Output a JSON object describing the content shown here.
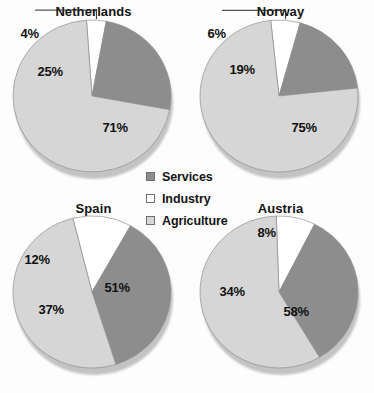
{
  "chart_data": [
    {
      "type": "pie",
      "title": "Netherlands",
      "categories": [
        "Industry",
        "Services",
        "Agriculture"
      ],
      "values": [
        4,
        25,
        71
      ],
      "labels": [
        "4%",
        "25%",
        "71%"
      ],
      "colors": [
        "#ffffff",
        "#8d8d8d",
        "#d6d6d6"
      ],
      "legend_position": "center",
      "has_leader_line": true
    },
    {
      "type": "pie",
      "title": "Norway",
      "categories": [
        "Industry",
        "Services",
        "Agriculture"
      ],
      "values": [
        6,
        19,
        75
      ],
      "labels": [
        "6%",
        "19%",
        "75%"
      ],
      "colors": [
        "#ffffff",
        "#8d8d8d",
        "#d6d6d6"
      ],
      "legend_position": "center",
      "has_leader_line": true
    },
    {
      "type": "pie",
      "title": "Spain",
      "categories": [
        "Industry",
        "Services",
        "Agriculture"
      ],
      "values": [
        12,
        37,
        51
      ],
      "labels": [
        "12%",
        "37%",
        "51%"
      ],
      "colors": [
        "#ffffff",
        "#8d8d8d",
        "#d6d6d6"
      ],
      "legend_position": "center",
      "has_leader_line": false
    },
    {
      "type": "pie",
      "title": "Austria",
      "categories": [
        "Industry",
        "Services",
        "Agriculture"
      ],
      "values": [
        8,
        34,
        58
      ],
      "labels": [
        "8%",
        "34%",
        "58%"
      ],
      "colors": [
        "#ffffff",
        "#8d8d8d",
        "#d6d6d6"
      ],
      "legend_position": "center",
      "has_leader_line": false
    }
  ],
  "legend": {
    "items": [
      {
        "label": "Services",
        "color": "#8d8d8d"
      },
      {
        "label": "Industry",
        "color": "#ffffff"
      },
      {
        "label": "Agriculture",
        "color": "#d6d6d6"
      }
    ]
  },
  "charts": {
    "netherlands": {
      "title": "Netherlands",
      "industry_label": "4%",
      "services_label": "25%",
      "agriculture_label": "71%"
    },
    "norway": {
      "title": "Norway",
      "industry_label": "6%",
      "services_label": "19%",
      "agriculture_label": "75%"
    },
    "spain": {
      "title": "Spain",
      "industry_label": "12%",
      "services_label": "37%",
      "agriculture_label": "51%"
    },
    "austria": {
      "title": "Austria",
      "industry_label": "8%",
      "services_label": "34%",
      "agriculture_label": "58%"
    }
  }
}
